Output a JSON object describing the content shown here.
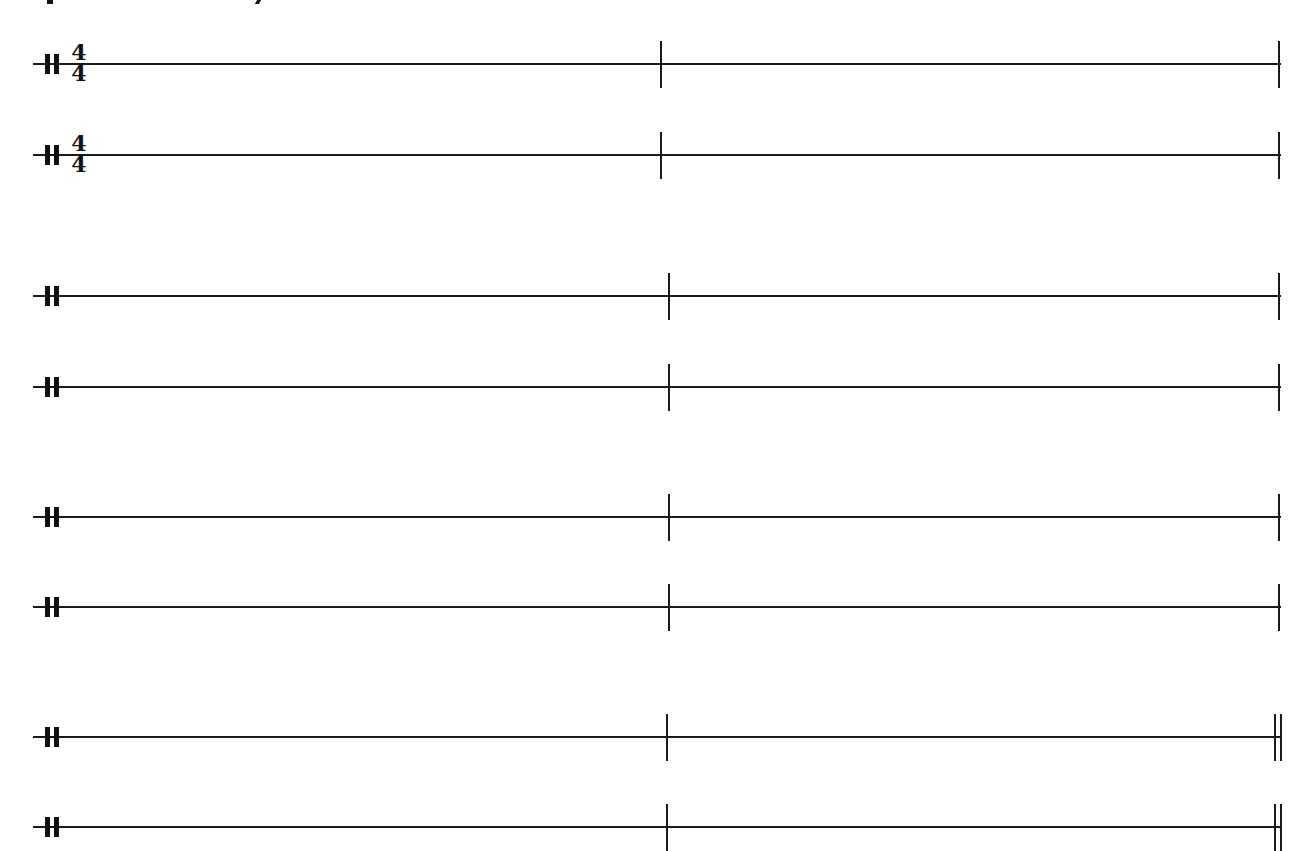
{
  "page": {
    "background": "#ffffff",
    "ink_color": "#1a1a1a",
    "clipped_text_fragments": [
      "p",
      "y"
    ]
  },
  "score": {
    "instrument": "percussion",
    "clef": "percussion-clef",
    "time_signature": {
      "numerator": "4",
      "denominator": "4"
    },
    "staves_per_system": 2,
    "measures_per_system": 2,
    "systems": [
      {
        "index": 1,
        "lines_y": [
          64,
          155
        ],
        "show_time_signature": true,
        "mid_barline_x": 661,
        "end_barline": "single"
      },
      {
        "index": 2,
        "lines_y": [
          296,
          387
        ],
        "show_time_signature": false,
        "mid_barline_x": 669,
        "end_barline": "single"
      },
      {
        "index": 3,
        "lines_y": [
          517,
          607
        ],
        "show_time_signature": false,
        "mid_barline_x": 669,
        "end_barline": "single"
      },
      {
        "index": 4,
        "lines_y": [
          737,
          827
        ],
        "show_time_signature": false,
        "mid_barline_x": 667,
        "end_barline": "final-double"
      }
    ],
    "measures": [
      {
        "number": 1,
        "content": "empty"
      },
      {
        "number": 2,
        "content": "empty"
      },
      {
        "number": 3,
        "content": "empty"
      },
      {
        "number": 4,
        "content": "empty"
      },
      {
        "number": 5,
        "content": "empty"
      },
      {
        "number": 6,
        "content": "empty"
      },
      {
        "number": 7,
        "content": "empty"
      },
      {
        "number": 8,
        "content": "empty"
      }
    ]
  }
}
